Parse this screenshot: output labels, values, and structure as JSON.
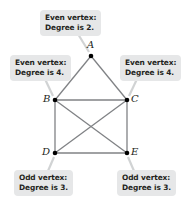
{
  "diagram": {
    "type": "graph",
    "vertices": [
      {
        "id": "A",
        "label": "A",
        "x": 91,
        "y": 56,
        "degree": 2,
        "parity": "even"
      },
      {
        "id": "B",
        "label": "B",
        "x": 55,
        "y": 100,
        "degree": 4,
        "parity": "even"
      },
      {
        "id": "C",
        "label": "C",
        "x": 127,
        "y": 100,
        "degree": 4,
        "parity": "even"
      },
      {
        "id": "D",
        "label": "D",
        "x": 55,
        "y": 153,
        "degree": 3,
        "parity": "odd"
      },
      {
        "id": "E",
        "label": "E",
        "x": 127,
        "y": 153,
        "degree": 3,
        "parity": "odd"
      }
    ],
    "edges": [
      [
        "A",
        "B"
      ],
      [
        "A",
        "C"
      ],
      [
        "B",
        "C"
      ],
      [
        "B",
        "D"
      ],
      [
        "C",
        "E"
      ],
      [
        "D",
        "E"
      ],
      [
        "B",
        "E"
      ],
      [
        "C",
        "D"
      ]
    ],
    "callouts": {
      "A": {
        "line1": "Even vertex:",
        "line2": "Degree is 2."
      },
      "B": {
        "line1": "Even vertex:",
        "line2": "Degree is 4."
      },
      "C": {
        "line1": "Even vertex:",
        "line2": "Degree is 4."
      },
      "D": {
        "line1": "Odd vertex:",
        "line2": "Degree is 3."
      },
      "E": {
        "line1": "Odd vertex:",
        "line2": "Degree is 3."
      }
    },
    "colors": {
      "edge": "#808285",
      "vertex": "#000000",
      "callout_bg": "#e6e7e8",
      "callout_pointer": "#d1d3d4",
      "text": "#231f20"
    }
  }
}
